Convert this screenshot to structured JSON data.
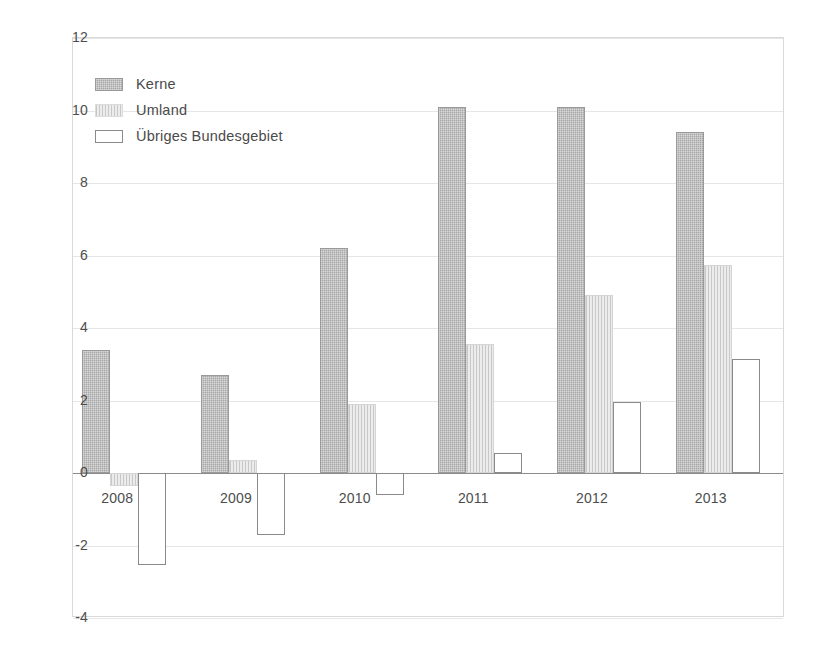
{
  "chart_data": {
    "type": "bar",
    "title": "",
    "subtitle": "",
    "xlabel": "",
    "ylabel": "",
    "categories": [
      "2008",
      "2009",
      "2010",
      "2011",
      "2012",
      "2013"
    ],
    "series": [
      {
        "name": "Kerne",
        "values": [
          3.4,
          2.7,
          6.2,
          10.1,
          10.1,
          9.4
        ],
        "color": "#a6a6a6"
      },
      {
        "name": "Umland",
        "values": [
          -0.35,
          0.35,
          1.9,
          3.55,
          4.9,
          5.75
        ],
        "color": "#ececec"
      },
      {
        "name": "Übriges Bundesgebiet",
        "values": [
          -2.55,
          -1.7,
          -0.6,
          0.55,
          1.95,
          3.15
        ],
        "color": "#ffffff"
      }
    ],
    "ylim": [
      -4,
      12
    ],
    "yticks": [
      12,
      10,
      8,
      6,
      4,
      2,
      0,
      -2,
      -4
    ],
    "ytick_labels": [
      "12",
      "10",
      "8",
      "6",
      "4",
      "2",
      "0",
      "-2",
      "-4"
    ],
    "grid": true,
    "legend_position": "top-left",
    "zero_line": 0
  },
  "legend": {
    "items": [
      {
        "label": "Kerne",
        "swatch": "kerne"
      },
      {
        "label": "Umland",
        "swatch": "umland"
      },
      {
        "label": "Übriges Bundesgebiet",
        "swatch": "uebriges"
      }
    ]
  }
}
